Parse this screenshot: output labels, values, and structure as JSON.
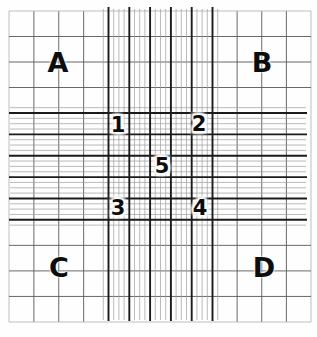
{
  "figure": {
    "name": "hemocytometer-counting-grid",
    "background_color": "#fefefe",
    "line_colors": {
      "thick": "#1b1b1b",
      "thin": "#9d9d9d",
      "coarse": "#585858",
      "boundary": "#b8b8b8"
    },
    "layout": {
      "width": 317,
      "height": 337,
      "outer": {
        "left": 9,
        "top": 11,
        "right": 311,
        "bottom": 322
      },
      "central": {
        "left": 108.5,
        "top": 113,
        "right": 212.5,
        "bottom": 219.8
      },
      "central_divisions": 5,
      "central_subdivisions": 4,
      "corner_divisions": 4,
      "band_overhang": {
        "v_top": 7,
        "v_bottom": 321,
        "h_left": 9,
        "h_right": 307
      },
      "thick_width": 1.9,
      "thin_width": 0.7,
      "coarse_width": 0.9
    },
    "corner_labels": [
      {
        "text": "A",
        "x": 58,
        "y": 62
      },
      {
        "text": "B",
        "x": 262,
        "y": 62
      },
      {
        "text": "C",
        "x": 59,
        "y": 267
      },
      {
        "text": "D",
        "x": 264,
        "y": 267
      }
    ],
    "square_labels": [
      {
        "text": "1",
        "x": 118,
        "y": 125
      },
      {
        "text": "2",
        "x": 199,
        "y": 124
      },
      {
        "text": "3",
        "x": 118,
        "y": 208
      },
      {
        "text": "4",
        "x": 200,
        "y": 208
      },
      {
        "text": "5",
        "x": 162,
        "y": 166
      }
    ]
  }
}
